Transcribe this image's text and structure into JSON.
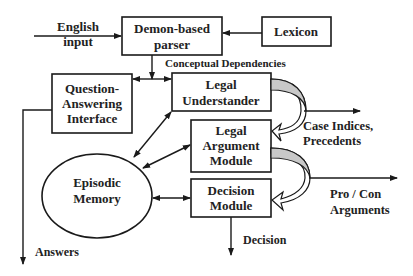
{
  "diagram": {
    "title": "",
    "colors": {
      "stroke": "#1a1a1a",
      "text": "#222222",
      "curve_fill": "#c8c8c8",
      "background": "#ffffff"
    },
    "labels": {
      "english_input_line1": "English",
      "english_input_line2": "input",
      "conceptual_dependencies": "Conceptual Dependencies",
      "case_indices_line1": "Case Indices,",
      "case_indices_line2": "Precedents",
      "pro_con_line1": "Pro / Con",
      "pro_con_line2": "Arguments",
      "decision": "Decision",
      "answers": "Answers"
    },
    "nodes": {
      "parser": {
        "line1": "Demon-based",
        "line2": "parser"
      },
      "lexicon": {
        "line1": "Lexicon"
      },
      "qa_interface": {
        "line1": "Question-",
        "line2": "Answering",
        "line3": "Interface"
      },
      "legal_understander": {
        "line1": "Legal",
        "line2": "Understander"
      },
      "legal_argument": {
        "line1": "Legal",
        "line2": "Argument",
        "line3": "Module"
      },
      "decision_module": {
        "line1": "Decision",
        "line2": "Module"
      },
      "episodic_memory": {
        "line1": "Episodic",
        "line2": "Memory"
      }
    },
    "edges": [
      {
        "from": "English input",
        "to": "Demon-based parser"
      },
      {
        "from": "Lexicon",
        "to": "Demon-based parser"
      },
      {
        "from": "Demon-based parser",
        "to": "Question-Answering Interface",
        "label": "Conceptual Dependencies"
      },
      {
        "from": "Demon-based parser",
        "to": "Legal Understander",
        "label": "Conceptual Dependencies"
      },
      {
        "from": "Legal Understander",
        "to": "Episodic Memory",
        "bidirectional": true
      },
      {
        "from": "Legal Argument Module",
        "to": "Episodic Memory",
        "bidirectional": true
      },
      {
        "from": "Decision Module",
        "to": "Episodic Memory",
        "bidirectional": true
      },
      {
        "from": "Legal Understander",
        "to": "Legal Argument Module",
        "style": "curved"
      },
      {
        "from": "Legal Understander",
        "to": "output",
        "label": "Case Indices, Precedents"
      },
      {
        "from": "Legal Argument Module",
        "to": "Decision Module",
        "style": "curved"
      },
      {
        "from": "Legal Argument Module",
        "to": "output",
        "label": "Pro / Con Arguments"
      },
      {
        "from": "Decision Module",
        "to": "output",
        "label": "Decision"
      },
      {
        "from": "Question-Answering Interface",
        "to": "output",
        "label": "Answers"
      }
    ]
  }
}
